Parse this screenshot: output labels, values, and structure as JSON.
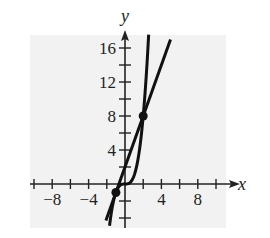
{
  "chart_data": {
    "type": "line",
    "title": "",
    "xlabel": "x",
    "ylabel": "y",
    "xlim": [
      -11,
      11
    ],
    "ylim": [
      -4,
      17
    ],
    "x_ticks": [
      -10,
      -8,
      -6,
      -4,
      -2,
      0,
      2,
      4,
      6,
      8,
      10
    ],
    "x_tick_labels": [
      "-8",
      "-4",
      "4",
      "8"
    ],
    "x_tick_label_values": [
      -8,
      -4,
      4,
      8
    ],
    "y_ticks": [
      -4,
      -2,
      2,
      4,
      6,
      8,
      10,
      12,
      14,
      16
    ],
    "y_tick_labels": [
      "4",
      "8",
      "12",
      "16"
    ],
    "y_tick_label_values": [
      4,
      8,
      12,
      16
    ],
    "grid": false,
    "background": "#f2f2f2",
    "series": [
      {
        "name": "y = x^3",
        "function": "x^3",
        "x_range": [
          -1.7,
          2.6
        ],
        "color": "#111111"
      },
      {
        "name": "y = 3x + 2",
        "function": "3x+2",
        "x_range": [
          -2.1,
          5.0
        ],
        "color": "#111111"
      }
    ],
    "points": [
      {
        "x": -1,
        "y": -1,
        "label": ""
      },
      {
        "x": 2,
        "y": 8,
        "label": ""
      }
    ]
  }
}
